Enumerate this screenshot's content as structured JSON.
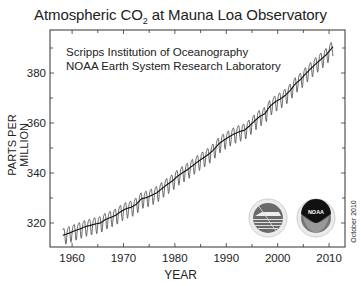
{
  "chart_data": {
    "type": "line",
    "title": "Atmospheric CO2 at Mauna Loa Observatory",
    "title_parts": {
      "before": "Atmospheric CO",
      "sub": "2",
      "after": " at Mauna Loa Observatory"
    },
    "xlabel": "YEAR",
    "ylabel": "PARTS PER MILLION",
    "xlim": [
      1955.7,
      2013.1
    ],
    "ylim": [
      310.4,
      397.2
    ],
    "xticks": [
      1960,
      1970,
      1980,
      1990,
      2000,
      2010
    ],
    "yticks": [
      320,
      340,
      360,
      380
    ],
    "grid": false,
    "annotations": [
      "Scripps Institution of Oceanography",
      "NOAA Earth System Research Laboratory"
    ],
    "date_stamp": "October 2010",
    "series": [
      {
        "name": "Monthly mean CO2 (seasonal cycle)",
        "seasonal_amplitude_ppm": 3.2
      },
      {
        "name": "Annual mean (deseasonalized trend)"
      }
    ],
    "x": [
      1958,
      1959,
      1960,
      1961,
      1962,
      1963,
      1964,
      1965,
      1966,
      1967,
      1968,
      1969,
      1970,
      1971,
      1972,
      1973,
      1974,
      1975,
      1976,
      1977,
      1978,
      1979,
      1980,
      1981,
      1982,
      1983,
      1984,
      1985,
      1986,
      1987,
      1988,
      1989,
      1990,
      1991,
      1992,
      1993,
      1994,
      1995,
      1996,
      1997,
      1998,
      1999,
      2000,
      2001,
      2002,
      2003,
      2004,
      2005,
      2006,
      2007,
      2008,
      2009,
      2010
    ],
    "values": [
      315.3,
      316.0,
      316.9,
      317.6,
      318.5,
      319.0,
      319.6,
      320.0,
      321.4,
      322.2,
      323.1,
      324.6,
      325.7,
      326.3,
      327.5,
      329.7,
      330.2,
      331.1,
      332.1,
      333.8,
      335.4,
      336.8,
      338.7,
      340.1,
      341.4,
      343.0,
      344.6,
      346.0,
      347.4,
      349.2,
      351.6,
      353.1,
      354.4,
      355.6,
      356.5,
      357.1,
      358.8,
      360.8,
      362.6,
      363.7,
      366.7,
      368.4,
      369.6,
      371.1,
      373.2,
      375.8,
      377.5,
      379.8,
      381.9,
      383.8,
      385.6,
      387.4,
      389.9
    ]
  },
  "logos": {
    "left": "scripps-logo",
    "right": "noaa-logo",
    "noaa_text": "NOAA"
  }
}
